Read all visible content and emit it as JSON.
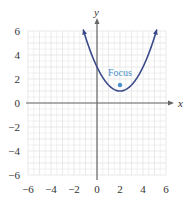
{
  "chart_data": {
    "type": "line",
    "title": "",
    "xlabel": "x",
    "ylabel": "y",
    "xlim": [
      -6,
      6
    ],
    "ylim": [
      -6,
      6
    ],
    "grid": true,
    "x_ticks": [
      "−6",
      "−4",
      "−2",
      "0",
      "2",
      "4",
      "6"
    ],
    "y_ticks": [
      "6",
      "4",
      "2",
      "0",
      "−2",
      "−4",
      "−6"
    ],
    "series": [
      {
        "name": "parabola",
        "equation": "y = (x - 2)^2 / 2 + 1",
        "vertex": [
          2,
          1
        ],
        "x_range": [
          -1.2,
          5.2
        ],
        "color": "#3a4a8a"
      }
    ],
    "points": [
      {
        "label": "Focus",
        "x": 2,
        "y": 1.5,
        "color": "#4a90c8"
      }
    ],
    "annotations": [
      {
        "text": "Focus",
        "x": 2,
        "y": 2.3
      }
    ]
  },
  "colors": {
    "grid": "#e3e3e3",
    "axis": "#666666",
    "curve": "#3a4a8a",
    "focus": "#4a90c8"
  }
}
